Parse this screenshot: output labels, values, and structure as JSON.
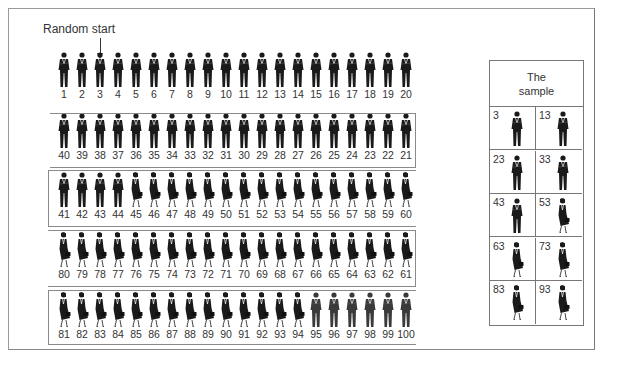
{
  "figure": {
    "start_label": "Random start",
    "population_size": 100,
    "interval": 10,
    "random_start": 3,
    "rows": [
      {
        "direction": "ltr",
        "numbers": [
          1,
          2,
          3,
          4,
          5,
          6,
          7,
          8,
          9,
          10,
          11,
          12,
          13,
          14,
          15,
          16,
          17,
          18,
          19,
          20
        ]
      },
      {
        "direction": "rtl",
        "numbers": [
          40,
          39,
          38,
          37,
          36,
          35,
          34,
          33,
          32,
          31,
          30,
          29,
          28,
          27,
          26,
          25,
          24,
          23,
          22,
          21
        ]
      },
      {
        "direction": "ltr",
        "numbers": [
          41,
          42,
          43,
          44,
          45,
          46,
          47,
          48,
          49,
          50,
          51,
          52,
          53,
          54,
          55,
          56,
          57,
          58,
          59,
          60
        ]
      },
      {
        "direction": "rtl",
        "numbers": [
          80,
          79,
          78,
          77,
          76,
          75,
          74,
          73,
          72,
          71,
          70,
          69,
          68,
          67,
          66,
          65,
          64,
          63,
          62,
          61
        ]
      },
      {
        "direction": "ltr",
        "numbers": [
          81,
          82,
          83,
          84,
          85,
          86,
          87,
          88,
          89,
          90,
          91,
          92,
          93,
          94,
          95,
          96,
          97,
          98,
          99,
          100
        ]
      }
    ],
    "figure_types": {
      "man": [
        1,
        2,
        3,
        4,
        5,
        6,
        7,
        8,
        9,
        10,
        11,
        12,
        13,
        14,
        15,
        16,
        17,
        18,
        19,
        20,
        21,
        22,
        23,
        24,
        25,
        26,
        27,
        28,
        29,
        30,
        31,
        32,
        33,
        34,
        35,
        36,
        37,
        38,
        39,
        40,
        41,
        42,
        43,
        44,
        95,
        96,
        97,
        98,
        99,
        100
      ],
      "woman": [
        45,
        46,
        47,
        48,
        49,
        50,
        51,
        52,
        53,
        54,
        55,
        56,
        57,
        58,
        59,
        60,
        61,
        62,
        63,
        64,
        65,
        66,
        67,
        68,
        69,
        70,
        71,
        72,
        73,
        74,
        75,
        76,
        77,
        78,
        79,
        80,
        81,
        82,
        83,
        84,
        85,
        86,
        87,
        88,
        89,
        90,
        91,
        92,
        93,
        94
      ]
    }
  },
  "sample": {
    "title_line1": "The",
    "title_line2": "sample",
    "items": [
      {
        "number": "3",
        "type": "man"
      },
      {
        "number": "13",
        "type": "man"
      },
      {
        "number": "23",
        "type": "man"
      },
      {
        "number": "33",
        "type": "man"
      },
      {
        "number": "43",
        "type": "man"
      },
      {
        "number": "53",
        "type": "woman"
      },
      {
        "number": "63",
        "type": "woman"
      },
      {
        "number": "73",
        "type": "woman"
      },
      {
        "number": "83",
        "type": "woman"
      },
      {
        "number": "93",
        "type": "woman"
      }
    ]
  },
  "colors": {
    "figure": "#1a1a1a",
    "figure_light": "#3a3a3a",
    "border": "#8a8a8a"
  }
}
